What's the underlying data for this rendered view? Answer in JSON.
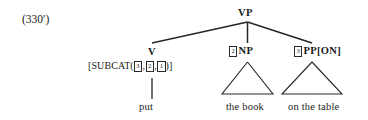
{
  "figure": {
    "example_number": "(330′)",
    "type": "syntax-tree",
    "ink_color": "#262626",
    "background_color": "#ffffff"
  },
  "tree": {
    "root": {
      "label": "VP",
      "name": "vp"
    },
    "children": [
      {
        "name": "v",
        "label": "V",
        "index_tag": null,
        "feature_bracket": {
          "open": "[SUBCAT(",
          "feature": "SUBCAT",
          "tags": [
            "3",
            "2",
            "1"
          ],
          "separator": ",",
          "close": ")]",
          "full_text": "[SUBCAT(3,2,1)]"
        },
        "terminal": "put",
        "has_triangle": false
      },
      {
        "name": "np",
        "label": "NP",
        "index_tag": "2",
        "feature_bracket": null,
        "terminal": "the book",
        "has_triangle": true
      },
      {
        "name": "pp",
        "label": "PP[ON]",
        "index_tag": "3",
        "feature_bracket": null,
        "terminal": "on the table",
        "has_triangle": true
      }
    ]
  }
}
